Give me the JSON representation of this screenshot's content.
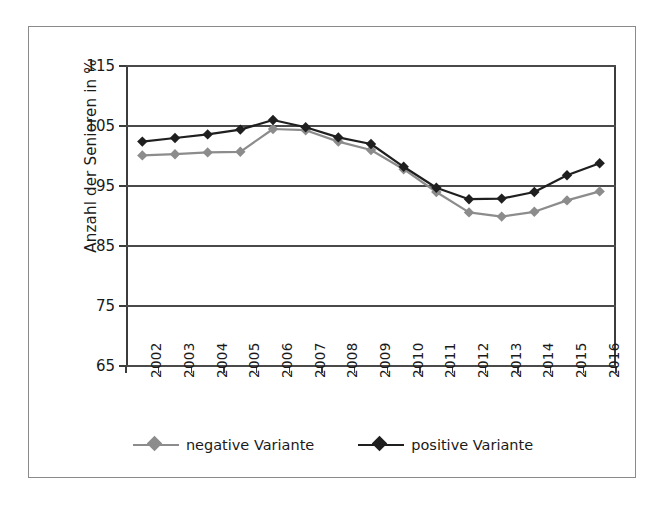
{
  "chart_data": {
    "type": "line",
    "title": "",
    "xlabel": "",
    "ylabel": "Anzahl der Senioren in %",
    "ylim": [
      65,
      115
    ],
    "ytick_labels": [
      "115",
      "105",
      "95",
      "85",
      "75",
      "65"
    ],
    "yticks": [
      115,
      105,
      95,
      85,
      75,
      65
    ],
    "grid": true,
    "legend_position": "bottom",
    "categories": [
      "2002",
      "2003",
      "2004",
      "2005",
      "2006",
      "2007",
      "2008",
      "2009",
      "2010",
      "2011",
      "2012",
      "2013",
      "2014",
      "2015",
      "2016"
    ],
    "series": [
      {
        "name": "negative Variante",
        "color": "#8c8c8c",
        "marker": "diamond",
        "values": [
          100.1,
          100.3,
          100.6,
          100.7,
          104.5,
          104.3,
          102.4,
          101.0,
          97.8,
          94.0,
          90.6,
          89.9,
          90.7,
          92.6,
          94.1
        ]
      },
      {
        "name": "positive Variante",
        "color": "#1f1f1f",
        "marker": "diamond",
        "values": [
          102.4,
          103.0,
          103.6,
          104.4,
          106.0,
          104.8,
          103.1,
          102.0,
          98.2,
          94.7,
          92.8,
          92.9,
          94.0,
          96.8,
          98.8
        ]
      }
    ]
  },
  "legend": {
    "items": [
      {
        "label": "negative Variante",
        "color": "#8c8c8c"
      },
      {
        "label": "positive Variante",
        "color": "#1f1f1f"
      }
    ]
  }
}
